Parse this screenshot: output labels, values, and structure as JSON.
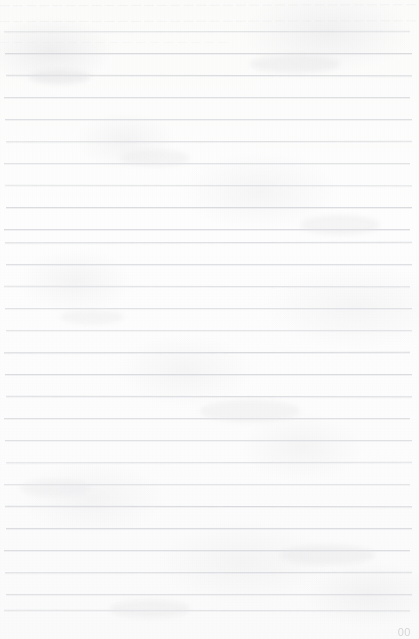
{
  "document": {
    "kind": "scanned-ruled-notebook-page",
    "page_width": 419,
    "page_height": 639,
    "paper_color": "#fdfdfc",
    "rule_color": "#d6d8dc",
    "ink_color": "#d9dade"
  },
  "ruling": {
    "line_count": 27,
    "spacing_px": 22,
    "first_line_y": 31,
    "line_left_x": 5,
    "line_right_x": 412,
    "lines_y": [
      31,
      53,
      75,
      97,
      119,
      141,
      163,
      185,
      207,
      229,
      242,
      264,
      286,
      308,
      330,
      352,
      374,
      396,
      418,
      440,
      462,
      484,
      506,
      528,
      550,
      572,
      594,
      610
    ]
  },
  "ghost_text": {
    "note": "faint illegible bleed-through / faded ink at top of page",
    "line_1": "— — — — — — — — — — — — — — — — — — — — — — — — — — — — — — — — — — — — — —",
    "line_2": "— — — — — — — — — — — — — — — — — — — — — — — — — — — — — — — — — — — — —",
    "line_3": "— — — — — — — — — — — — — — — — —"
  },
  "footer": {
    "page_number": "00"
  }
}
